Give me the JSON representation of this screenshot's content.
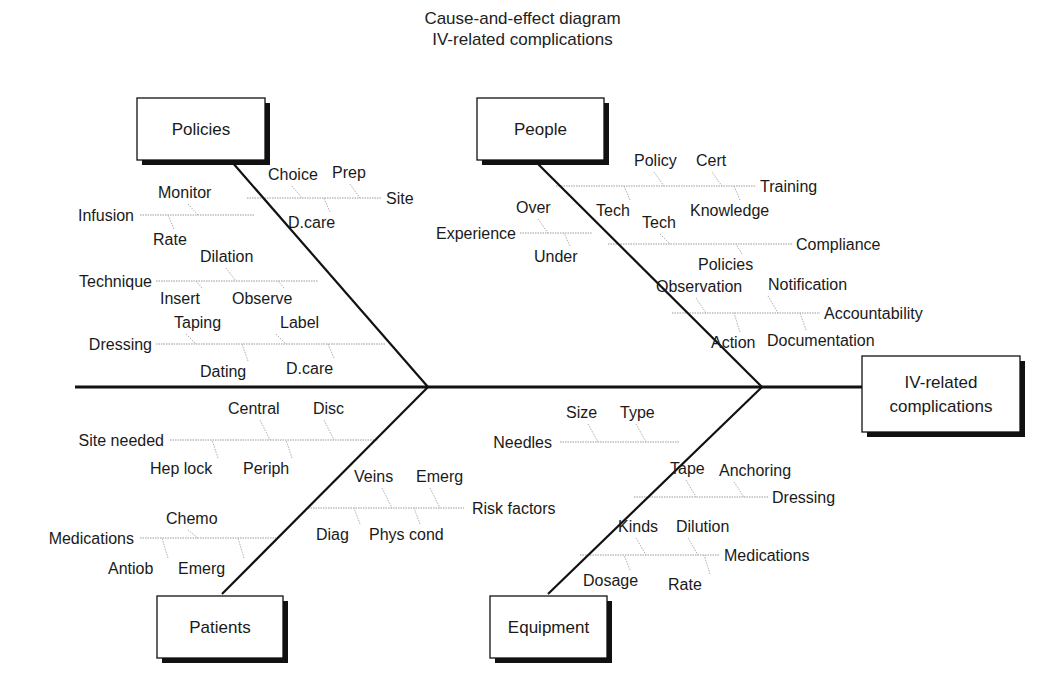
{
  "title": {
    "line1": "Cause-and-effect diagram",
    "line2": "IV-related complications"
  },
  "colors": {
    "line": "#111111",
    "rib": "#9a9a9a",
    "text": "#1a1a1a",
    "shadow": "#111111"
  },
  "spine": {
    "x1": 75,
    "x2": 862,
    "y": 387
  },
  "effect": {
    "lines": [
      "IV-related",
      "complications"
    ],
    "box": [
      862,
      356,
      158,
      76
    ]
  },
  "categories": [
    {
      "id": "policies",
      "label": "Policies",
      "box": [
        137,
        98,
        128,
        62
      ],
      "bone": [
        232,
        162,
        428,
        387
      ],
      "ribs": [
        {
          "label": "Site",
          "y": 198,
          "x1": 247,
          "x2": 382,
          "lx": 386,
          "anchor": "start",
          "subs": [
            {
              "label": "Choice",
              "x": 268,
              "y": 180,
              "lx": 302,
              "ly": 198
            },
            {
              "label": "Prep",
              "x": 332,
              "y": 178,
              "lx": 360,
              "ly": 198
            },
            {
              "label": "D.care",
              "x": 288,
              "y": 228,
              "lx": 324,
              "ly": 198
            }
          ]
        },
        {
          "label": "Infusion",
          "y": 215,
          "x1": 140,
          "x2": 255,
          "lx": 134,
          "anchor": "end",
          "subs": [
            {
              "label": "Monitor",
              "x": 158,
              "y": 198,
              "lx": 198,
              "ly": 215
            },
            {
              "label": "Rate",
              "x": 153,
              "y": 245,
              "lx": 168,
              "ly": 215
            }
          ]
        },
        {
          "label": "Technique",
          "y": 281,
          "x1": 156,
          "x2": 318,
          "lx": 152,
          "anchor": "end",
          "subs": [
            {
              "label": "Dilation",
              "x": 200,
              "y": 262,
              "lx": 236,
              "ly": 281
            },
            {
              "label": "Insert",
              "x": 160,
              "y": 304,
              "lx": 196,
              "ly": 281
            },
            {
              "label": "Observe",
              "x": 232,
              "y": 304,
              "lx": 278,
              "ly": 281
            }
          ]
        },
        {
          "label": "Dressing",
          "y": 344,
          "x1": 156,
          "x2": 386,
          "lx": 152,
          "anchor": "end",
          "subs": [
            {
              "label": "Taping",
              "x": 174,
              "y": 328,
              "lx": 196,
              "ly": 344
            },
            {
              "label": "Label",
              "x": 280,
              "y": 328,
              "lx": 286,
              "ly": 344
            },
            {
              "label": "Dating",
              "x": 200,
              "y": 377,
              "lx": 242,
              "ly": 344
            },
            {
              "label": "D.care",
              "x": 286,
              "y": 374,
              "lx": 328,
              "ly": 344
            }
          ]
        }
      ]
    },
    {
      "id": "people",
      "label": "People",
      "box": [
        477,
        98,
        127,
        62
      ],
      "bone": [
        538,
        164,
        762,
        387
      ],
      "ribs": [
        {
          "label": "Training",
          "y": 186,
          "x1": 556,
          "x2": 756,
          "lx": 760,
          "anchor": "start",
          "subs": [
            {
              "label": "Policy",
              "x": 634,
              "y": 166,
              "lx": 664,
              "ly": 186
            },
            {
              "label": "Cert",
              "x": 696,
              "y": 166,
              "lx": 722,
              "ly": 186
            },
            {
              "label": "Tech",
              "x": 596,
              "y": 216,
              "lx": 624,
              "ly": 186
            },
            {
              "label": "Knowledge",
              "x": 690,
              "y": 216,
              "lx": 734,
              "ly": 186
            }
          ]
        },
        {
          "label": "Experience",
          "y": 233,
          "x1": 520,
          "x2": 592,
          "lx": 516,
          "anchor": "end",
          "subs": [
            {
              "label": "Over",
              "x": 516,
              "y": 213,
              "lx": 548,
              "ly": 233
            },
            {
              "label": "Under",
              "x": 534,
              "y": 262,
              "lx": 564,
              "ly": 233
            }
          ]
        },
        {
          "label": "Compliance",
          "y": 244,
          "x1": 608,
          "x2": 792,
          "lx": 796,
          "anchor": "start",
          "subs": [
            {
              "label": "Tech",
              "x": 642,
              "y": 228,
              "lx": 670,
              "ly": 244
            },
            {
              "label": "Policies",
              "x": 698,
              "y": 270,
              "lx": 736,
              "ly": 244
            }
          ]
        },
        {
          "label": "Accountability",
          "y": 313,
          "x1": 672,
          "x2": 820,
          "lx": 824,
          "anchor": "start",
          "subs": [
            {
              "label": "Observation",
              "x": 656,
              "y": 292,
              "lx": 706,
              "ly": 313
            },
            {
              "label": "Notification",
              "x": 768,
              "y": 290,
              "lx": 778,
              "ly": 313
            },
            {
              "label": "Action",
              "x": 711,
              "y": 348,
              "lx": 734,
              "ly": 313
            },
            {
              "label": "Documentation",
              "x": 767,
              "y": 346,
              "lx": 800,
              "ly": 313
            }
          ]
        }
      ]
    },
    {
      "id": "patients",
      "label": "Patients",
      "box": [
        157,
        596,
        126,
        62
      ],
      "bone": [
        222,
        594,
        428,
        387
      ],
      "ribs": [
        {
          "label": "Site needed",
          "y": 440,
          "x1": 170,
          "x2": 378,
          "lx": 164,
          "anchor": "end",
          "subs": [
            {
              "label": "Central",
              "x": 228,
              "y": 414,
              "lx": 270,
              "ly": 440
            },
            {
              "label": "Disc",
              "x": 313,
              "y": 414,
              "lx": 334,
              "ly": 440
            },
            {
              "label": "Hep lock",
              "x": 150,
              "y": 474,
              "lx": 212,
              "ly": 440
            },
            {
              "label": "Periph",
              "x": 243,
              "y": 474,
              "lx": 286,
              "ly": 440
            }
          ]
        },
        {
          "label": "Risk factors",
          "y": 508,
          "x1": 308,
          "x2": 464,
          "lx": 472,
          "anchor": "start",
          "subs": [
            {
              "label": "Veins",
              "x": 354,
              "y": 482,
              "lx": 392,
              "ly": 508
            },
            {
              "label": "Emerg",
              "x": 416,
              "y": 482,
              "lx": 440,
              "ly": 508
            },
            {
              "label": "Diag",
              "x": 316,
              "y": 540,
              "lx": 354,
              "ly": 508
            },
            {
              "label": "Phys cond",
              "x": 369,
              "y": 540,
              "lx": 414,
              "ly": 508
            }
          ]
        },
        {
          "label": "Medications",
          "y": 538,
          "x1": 140,
          "x2": 276,
          "lx": 134,
          "anchor": "end",
          "subs": [
            {
              "label": "Chemo",
              "x": 166,
              "y": 524,
              "lx": 198,
              "ly": 538
            },
            {
              "label": "Antiob",
              "x": 108,
              "y": 574,
              "lx": 162,
              "ly": 538
            },
            {
              "label": "Emerg",
              "x": 178,
              "y": 574,
              "lx": 238,
              "ly": 538
            }
          ]
        }
      ]
    },
    {
      "id": "equipment",
      "label": "Equipment",
      "box": [
        490,
        596,
        117,
        62
      ],
      "bone": [
        548,
        594,
        762,
        387
      ],
      "ribs": [
        {
          "label": "Needles",
          "y": 442,
          "x1": 560,
          "x2": 680,
          "lx": 552,
          "anchor": "end",
          "subs": [
            {
              "label": "Size",
              "x": 566,
              "y": 418,
              "lx": 598,
              "ly": 442
            },
            {
              "label": "Type",
              "x": 620,
              "y": 418,
              "lx": 646,
              "ly": 442
            }
          ]
        },
        {
          "label": "Dressing",
          "y": 497,
          "x1": 634,
          "x2": 768,
          "lx": 772,
          "anchor": "start",
          "subs": [
            {
              "label": "Tape",
              "x": 670,
              "y": 474,
              "lx": 696,
              "ly": 497
            },
            {
              "label": "Anchoring",
              "x": 719,
              "y": 476,
              "lx": 744,
              "ly": 497
            }
          ]
        },
        {
          "label": "Medications",
          "y": 555,
          "x1": 580,
          "x2": 720,
          "lx": 724,
          "anchor": "start",
          "subs": [
            {
              "label": "Kinds",
              "x": 618,
              "y": 532,
              "lx": 646,
              "ly": 555
            },
            {
              "label": "Dilution",
              "x": 676,
              "y": 532,
              "lx": 698,
              "ly": 555
            },
            {
              "label": "Dosage",
              "x": 583,
              "y": 586,
              "lx": 624,
              "ly": 555
            },
            {
              "label": "Rate",
              "x": 668,
              "y": 590,
              "lx": 704,
              "ly": 555
            }
          ]
        }
      ]
    }
  ]
}
